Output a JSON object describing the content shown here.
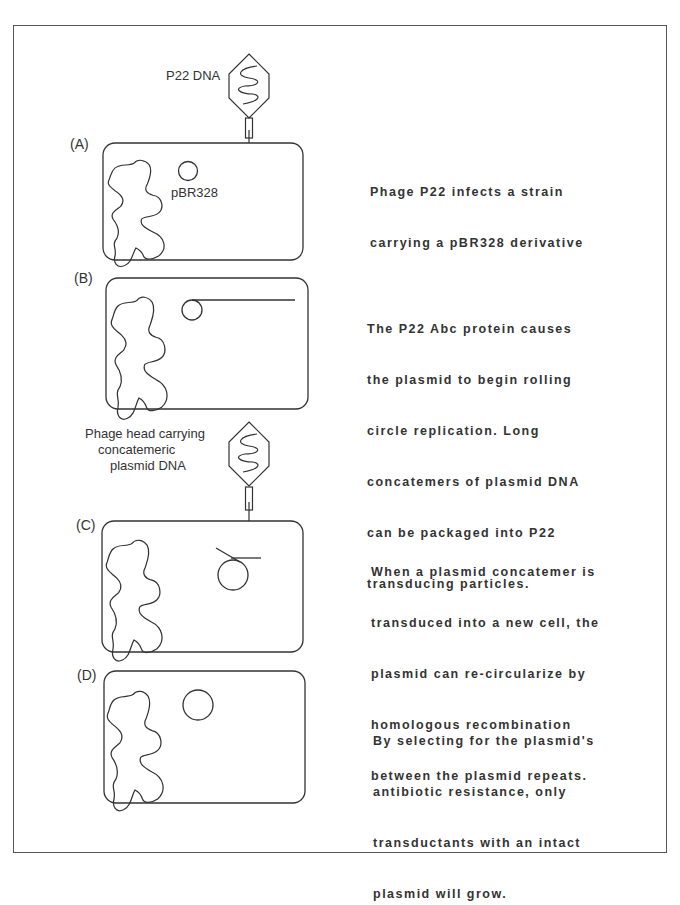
{
  "phage_a": {
    "label": "P22  DNA"
  },
  "phage_c": {
    "label_lines": [
      "Phage head carrying",
      "concatemeric",
      "plasmid  DNA"
    ]
  },
  "panels": [
    {
      "id": "A",
      "label": "(A)",
      "plasmid_label": "pBR328",
      "description_lines": [
        "Phage P22 infects a strain",
        "carrying a pBR328 derivative"
      ]
    },
    {
      "id": "B",
      "label": "(B)",
      "description_lines": [
        "The P22 Abc protein causes",
        "the plasmid to begin rolling",
        "circle replication.   Long",
        "concatemers of plasmid DNA",
        "can be packaged into P22",
        "transducing particles."
      ]
    },
    {
      "id": "C",
      "label": "(C)",
      "description_lines": [
        "When a plasmid concatemer is",
        "transduced into a new cell, the",
        "plasmid can re-circularize by",
        "homologous recombination",
        "between the plasmid repeats."
      ]
    },
    {
      "id": "D",
      "label": "(D)",
      "description_lines": [
        "By selecting for the plasmid's",
        "antibiotic resistance, only",
        "transductants with an intact",
        "plasmid will grow."
      ]
    }
  ]
}
